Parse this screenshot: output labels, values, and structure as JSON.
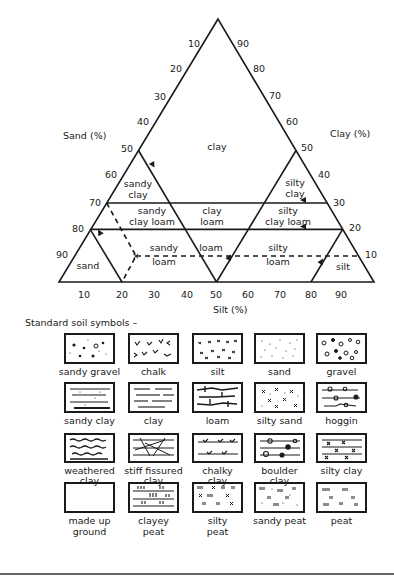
{
  "triangle": {
    "axes": {
      "sand_label": "Sand (%)",
      "clay_label": "Clay (%)",
      "silt_label": "Silt (%)"
    },
    "sand_ticks": [
      "10",
      "20",
      "30",
      "40",
      "50",
      "60",
      "70",
      "80",
      "90"
    ],
    "clay_ticks": [
      "90",
      "80",
      "70",
      "60",
      "50",
      "40",
      "30",
      "20",
      "10"
    ],
    "silt_ticks": [
      "10",
      "20",
      "30",
      "40",
      "50",
      "60",
      "70",
      "80",
      "90"
    ],
    "regions": {
      "clay": "clay",
      "sandy_clay_1": "sandy",
      "sandy_clay_2": "clay",
      "silty_clay_1": "silty",
      "silty_clay_2": "clay",
      "sandy_clay_loam_1": "sandy",
      "sandy_clay_loam_2": "clay loam",
      "clay_loam_1": "clay",
      "clay_loam_2": "loam",
      "silty_clay_loam_1": "silty",
      "silty_clay_loam_2": "clay loam",
      "sandy_loam_1": "sandy",
      "sandy_loam_2": "loam",
      "loam": "loam",
      "silty_loam_1": "silty",
      "silty_loam_2": "loam",
      "sand": "sand",
      "silt": "silt"
    }
  },
  "symbols": {
    "heading": "Standard soil symbols –",
    "items": [
      {
        "line1": "sandy gravel",
        "line2": ""
      },
      {
        "line1": "chalk",
        "line2": ""
      },
      {
        "line1": "silt",
        "line2": ""
      },
      {
        "line1": "sand",
        "line2": ""
      },
      {
        "line1": "gravel",
        "line2": ""
      },
      {
        "line1": "sandy clay",
        "line2": ""
      },
      {
        "line1": "clay",
        "line2": ""
      },
      {
        "line1": "loam",
        "line2": ""
      },
      {
        "line1": "silty sand",
        "line2": ""
      },
      {
        "line1": "hoggin",
        "line2": ""
      },
      {
        "line1": "weathered",
        "line2": "clay"
      },
      {
        "line1": "stiff fissured",
        "line2": "clay"
      },
      {
        "line1": "chalky",
        "line2": "clay"
      },
      {
        "line1": "boulder",
        "line2": "clay"
      },
      {
        "line1": "silty clay",
        "line2": ""
      },
      {
        "line1": "made up",
        "line2": "ground"
      },
      {
        "line1": "clayey",
        "line2": "peat"
      },
      {
        "line1": "silty",
        "line2": "peat"
      },
      {
        "line1": "sandy peat",
        "line2": ""
      },
      {
        "line1": "peat",
        "line2": ""
      }
    ]
  }
}
